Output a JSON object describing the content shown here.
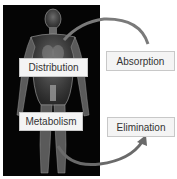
{
  "diagram": {
    "labels": {
      "distribution": "Distribution",
      "metabolism": "Metabolism",
      "absorption": "Absorption",
      "elimination": "Elimination"
    },
    "colors": {
      "panel_bg": "#050505",
      "figure": "#8a8a8a",
      "arrow": "#7a7a7a",
      "label_bg": "#f4f4f4",
      "label_border": "#c8c8c8"
    }
  }
}
